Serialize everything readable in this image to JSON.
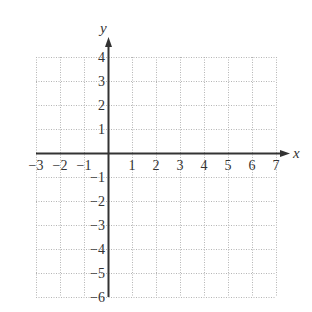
{
  "chart_data": {
    "type": "coordinate-grid",
    "title": "",
    "xlabel": "x",
    "ylabel": "y",
    "xlim": [
      -3,
      7
    ],
    "ylim": [
      -6,
      4
    ],
    "x_ticks": [
      -3,
      -2,
      -1,
      1,
      2,
      3,
      4,
      5,
      6,
      7
    ],
    "y_ticks": [
      4,
      3,
      2,
      1,
      -1,
      -2,
      -3,
      -4,
      -5,
      -6
    ],
    "x_tick_labels": [
      "−3",
      "−2",
      "−1",
      "1",
      "2",
      "3",
      "4",
      "5",
      "6",
      "7"
    ],
    "y_tick_labels": [
      "4",
      "3",
      "2",
      "1",
      "−1",
      "−2",
      "−3",
      "−4",
      "−5",
      "−6"
    ],
    "grid": true,
    "grid_style": "dotted",
    "series": []
  },
  "style": {
    "axis_color": "#333333",
    "grid_color": "#b5b5b5",
    "text_color": "#333333"
  },
  "layout": {
    "origin_px": [
      108,
      153
    ],
    "unit_px": 24
  }
}
